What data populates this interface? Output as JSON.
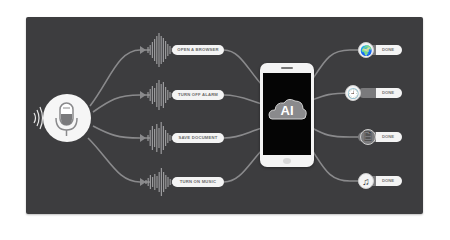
{
  "diagram": {
    "source": {
      "icon": "microphone-icon",
      "signal_icon": "sound-waves-icon"
    },
    "commands": [
      {
        "label": "OPEN A BROWSER"
      },
      {
        "label": "TURN OFF ALARM"
      },
      {
        "label": "SAVE DOCUMENT"
      },
      {
        "label": "TURN ON MUSIC"
      }
    ],
    "hub": {
      "device": "smartphone",
      "label": "AI",
      "icon": "cloud-icon"
    },
    "results": [
      {
        "icon": "globe-icon",
        "glyph": "🌍",
        "label": "DONE"
      },
      {
        "icon": "clock-icon",
        "glyph": "🕘",
        "label": "DONE"
      },
      {
        "icon": "document-icon",
        "glyph": "🗎",
        "label": "DONE"
      },
      {
        "icon": "music-note-icon",
        "glyph": "♫",
        "label": "DONE"
      }
    ],
    "colors": {
      "background": "#3d3d3f",
      "lines": "#8a8a8c",
      "pill": "#f4f4f4",
      "mic_accent": "#7a7a7c"
    }
  }
}
